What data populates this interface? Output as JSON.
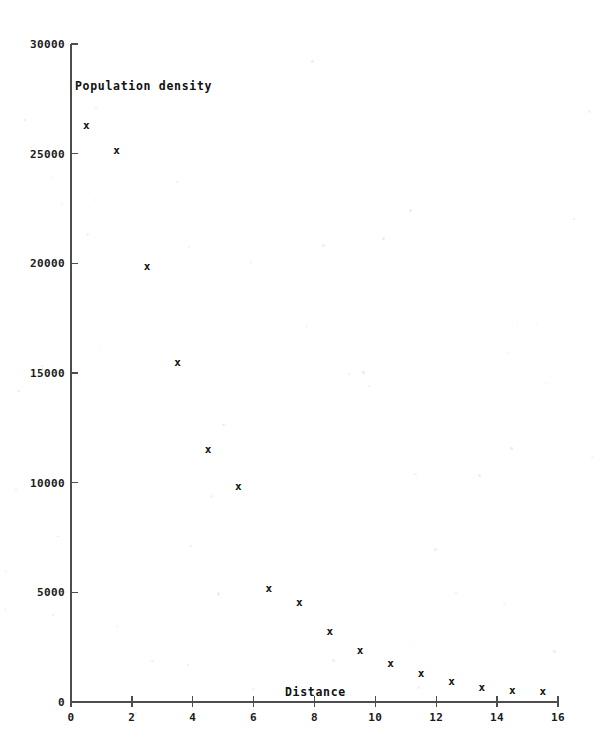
{
  "chart_data": {
    "type": "scatter",
    "title": "",
    "xlabel": "Distance",
    "ylabel": "Population density",
    "xlim": [
      0,
      16
    ],
    "ylim": [
      0,
      30000
    ],
    "x_ticks": [
      0,
      2,
      4,
      6,
      8,
      10,
      12,
      14,
      16
    ],
    "y_ticks": [
      0,
      5000,
      10000,
      15000,
      20000,
      25000,
      30000
    ],
    "x_tick_labels": [
      "0",
      "2",
      "4",
      "6",
      "8",
      "10",
      "12",
      "14",
      "16"
    ],
    "y_tick_labels": [
      "0",
      "5000",
      "10000",
      "15000",
      "20000",
      "25000",
      "30000"
    ],
    "grid": false,
    "legend": false,
    "marker": "x",
    "marker_color": "#101010",
    "axis_color": "#4d4d4d",
    "series": [
      {
        "name": "Population density vs distance",
        "x": [
          0.5,
          1.5,
          2.5,
          3.5,
          4.5,
          5.5,
          6.5,
          7.5,
          8.5,
          9.5,
          10.5,
          11.5,
          12.5,
          13.5,
          14.5,
          15.5
        ],
        "values": [
          26300,
          25150,
          19900,
          15500,
          11550,
          9850,
          5200,
          4550,
          3250,
          2350,
          1800,
          1300,
          950,
          700,
          550,
          500
        ]
      }
    ]
  },
  "labels": {
    "y_axis_title": "Population density",
    "x_axis_title": "Distance"
  }
}
